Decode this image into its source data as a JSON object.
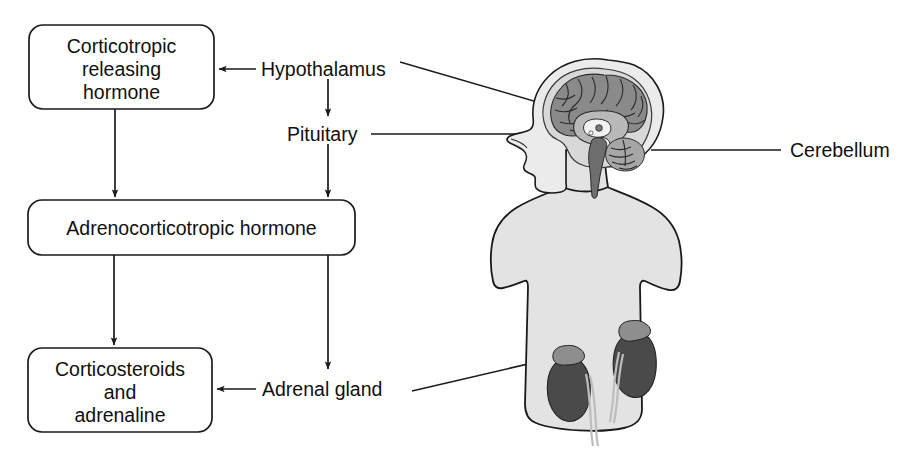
{
  "figure": {
    "background_color": "#ffffff",
    "line_color": "#1a1a1a",
    "body_fill_color": "#e3e3e3",
    "organ_fill_color": "#4a4a4a"
  },
  "flow_boxes": [
    {
      "id": "crh",
      "lines": [
        "Corticotropic",
        "releasing",
        "hormone"
      ]
    },
    {
      "id": "acth",
      "lines": [
        "Adrenocorticotropic hormone"
      ]
    },
    {
      "id": "corticosteroids",
      "lines": [
        "Corticosteroids",
        "and",
        "adrenaline"
      ]
    }
  ],
  "gland_labels": [
    {
      "id": "hypothalamus",
      "text": "Hypothalamus"
    },
    {
      "id": "pituitary",
      "text": "Pituitary"
    },
    {
      "id": "adrenal-gland",
      "text": "Adrenal gland"
    }
  ],
  "anatomy_callouts": [
    {
      "id": "cerebellum",
      "text": "Cerebellum"
    }
  ],
  "anatomy_parts": [
    "head-silhouette",
    "torso-silhouette",
    "brain-cortex",
    "brainstem",
    "cerebellum",
    "pituitary-gland",
    "left-kidney",
    "right-kidney",
    "left-adrenal-gland",
    "right-adrenal-gland"
  ]
}
